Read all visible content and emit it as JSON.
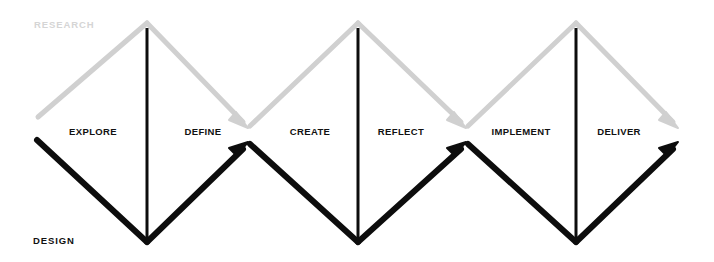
{
  "diagram": {
    "type": "double-diamond-triple",
    "background_color": "#ffffff",
    "tracks": [
      {
        "id": "research",
        "label": "RESEARCH",
        "color": "#d0d0d0",
        "text_color": "#d5d5d5",
        "direction": "descending",
        "x": 34,
        "y": 24
      },
      {
        "id": "design",
        "label": "DESIGN",
        "color": "#0d0d0d",
        "text_color": "#111111",
        "direction": "ascending",
        "x": 33,
        "y": 240
      }
    ],
    "phases": [
      {
        "id": "explore",
        "label": "EXPLORE",
        "x": 93,
        "y": 131,
        "diamond": 1,
        "side": "left"
      },
      {
        "id": "define",
        "label": "DEFINE",
        "x": 203,
        "y": 131,
        "diamond": 1,
        "side": "right"
      },
      {
        "id": "create",
        "label": "CREATE",
        "x": 310,
        "y": 131,
        "diamond": 2,
        "side": "left"
      },
      {
        "id": "reflect",
        "label": "REFLECT",
        "x": 401,
        "y": 131,
        "diamond": 2,
        "side": "right"
      },
      {
        "id": "implement",
        "label": "IMPLEMENT",
        "x": 521,
        "y": 131,
        "diamond": 3,
        "side": "left"
      },
      {
        "id": "deliver",
        "label": "DELIVER",
        "x": 619,
        "y": 131,
        "diamond": 3,
        "side": "right"
      }
    ],
    "diamonds": [
      {
        "id": "diamond-1",
        "apex_x": 147,
        "apex_y": 22,
        "base_y": 243,
        "left_x": 38,
        "right_x": 248
      },
      {
        "id": "diamond-2",
        "apex_x": 358,
        "apex_y": 22,
        "base_y": 243,
        "left_x": 248,
        "right_x": 466
      },
      {
        "id": "diamond-3",
        "apex_x": 576,
        "apex_y": 22,
        "base_y": 243,
        "left_x": 466,
        "right_x": 678
      }
    ],
    "waists": [
      {
        "id": "waist-start",
        "x": 38,
        "gray_y": 117,
        "black_y": 140
      },
      {
        "id": "waist-1",
        "x": 248,
        "gray_y": 127,
        "black_y": 143
      },
      {
        "id": "waist-2",
        "x": 466,
        "gray_y": 127,
        "black_y": 143
      },
      {
        "id": "waist-end",
        "x": 678,
        "gray_y": 127,
        "black_y": 143
      }
    ],
    "dividers": [
      {
        "id": "divider-1",
        "x": 147,
        "y1": 28,
        "y2": 238
      },
      {
        "id": "divider-2",
        "x": 358,
        "y1": 28,
        "y2": 238
      },
      {
        "id": "divider-3",
        "x": 576,
        "y1": 28,
        "y2": 238
      }
    ],
    "stroke_widths": {
      "gray": 5,
      "black": 6,
      "divider": 3
    }
  }
}
